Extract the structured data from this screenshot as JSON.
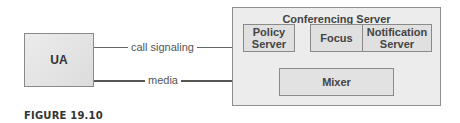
{
  "diagram": {
    "ua": {
      "label": "UA"
    },
    "conferencing_server": {
      "title": "Conferencing Server",
      "components": {
        "policy_server": "Policy\nServer",
        "focus": "Focus",
        "notification_server": "Notification\nServer",
        "mixer": "Mixer"
      }
    },
    "links": {
      "call_signaling": "call signaling",
      "media": "media"
    }
  },
  "caption": "FIGURE 19.10"
}
